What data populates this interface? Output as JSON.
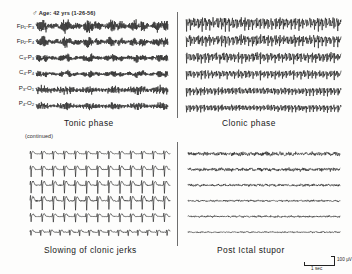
{
  "figure": {
    "header": {
      "sex_symbol": "♂",
      "text": "Age: 42 yrs (1-26-56)"
    },
    "continued_label": "(continued)",
    "channels": [
      {
        "label": "Fp1-F3",
        "name": "fp1-f3"
      },
      {
        "label": "Fp2-F4",
        "name": "fp2-f4"
      },
      {
        "label": "C3-P3",
        "name": "c3-p3"
      },
      {
        "label": "C4-P4",
        "name": "c4-p4"
      },
      {
        "label": "P3-O1",
        "name": "p3-o1"
      },
      {
        "label": "P4-O2",
        "name": "p4-o2"
      }
    ],
    "calibration": {
      "amplitude": "100 µV",
      "time": "1 sec"
    },
    "ink_color": "#1a1a1a",
    "background_color": "#fdfdfc"
  },
  "chart_data": {
    "type": "line",
    "title": "Age: 42 yrs (1-26-56)",
    "xlabel": "1 sec",
    "ylabel": "100 µV",
    "grid": false,
    "legend": "none",
    "channels": [
      "Fp1-F3",
      "Fp2-F4",
      "C3-P3",
      "C4-P4",
      "P3-O1",
      "P4-O2"
    ],
    "calibration": {
      "amplitude_uv": 100,
      "time_sec": 1
    },
    "panels": [
      {
        "id": "tonic-phase",
        "caption": "Tonic phase",
        "position": "top-left",
        "morphology": "continuous low-voltage fast recruiting rhythm",
        "dominant_frequency_hz": 14,
        "approx_amplitude_uv": [
          30,
          70
        ],
        "series": [
          {
            "name": "Fp1-F3",
            "freq_hz": 14,
            "amp_uv": 62,
            "noise": 0.55
          },
          {
            "name": "Fp2-F4",
            "freq_hz": 14,
            "amp_uv": 50,
            "noise": 0.5
          },
          {
            "name": "C3-P3",
            "freq_hz": 15,
            "amp_uv": 40,
            "noise": 0.45
          },
          {
            "name": "C4-P4",
            "freq_hz": 15,
            "amp_uv": 34,
            "noise": 0.45
          },
          {
            "name": "P3-O1",
            "freq_hz": 13,
            "amp_uv": 44,
            "noise": 0.5
          },
          {
            "name": "P4-O2",
            "freq_hz": 13,
            "amp_uv": 38,
            "noise": 0.48
          }
        ]
      },
      {
        "id": "clonic-phase",
        "caption": "Clonic phase",
        "position": "top-right",
        "morphology": "rhythmic high-voltage spike-and-slow-wave bursts",
        "dominant_frequency_hz": 4,
        "approx_amplitude_uv": [
          80,
          150
        ],
        "series": [
          {
            "name": "Fp1-F3",
            "freq_hz": 4.0,
            "amp_uv": 140,
            "noise": 0.35
          },
          {
            "name": "Fp2-F4",
            "freq_hz": 4.0,
            "amp_uv": 128,
            "noise": 0.35
          },
          {
            "name": "C3-P3",
            "freq_hz": 4.2,
            "amp_uv": 112,
            "noise": 0.32
          },
          {
            "name": "C4-P4",
            "freq_hz": 4.2,
            "amp_uv": 96,
            "noise": 0.32
          },
          {
            "name": "P3-O1",
            "freq_hz": 4.4,
            "amp_uv": 88,
            "noise": 0.3
          },
          {
            "name": "P4-O2",
            "freq_hz": 4.4,
            "amp_uv": 80,
            "noise": 0.3
          }
        ]
      },
      {
        "id": "slowing-of-clonic-jerks",
        "caption": "Slowing of clonic jerks",
        "position": "bottom-left",
        "morphology": "discrete periodic spike-wave complexes separated by flattening",
        "dominant_frequency_hz": 1.4,
        "approx_amplitude_uv": [
          60,
          120
        ],
        "series": [
          {
            "name": "Fp1-F3",
            "freq_hz": 1.4,
            "amp_uv": 70,
            "noise": 0.12
          },
          {
            "name": "Fp2-F4",
            "freq_hz": 1.4,
            "amp_uv": 96,
            "noise": 0.14
          },
          {
            "name": "C3-P3",
            "freq_hz": 1.4,
            "amp_uv": 108,
            "noise": 0.16
          },
          {
            "name": "C4-P4",
            "freq_hz": 1.4,
            "amp_uv": 120,
            "noise": 0.18
          },
          {
            "name": "P3-O1",
            "freq_hz": 1.4,
            "amp_uv": 74,
            "noise": 0.16
          },
          {
            "name": "P4-O2",
            "freq_hz": 1.6,
            "amp_uv": 62,
            "noise": 0.22
          }
        ]
      },
      {
        "id": "post-ictal-stupor",
        "caption": "Post Ictal stupor",
        "position": "bottom-right",
        "morphology": "marked generalized voltage suppression, near-flat record",
        "dominant_frequency_hz": 2,
        "approx_amplitude_uv": [
          3,
          10
        ],
        "series": [
          {
            "name": "Fp1-F3",
            "freq_hz": 2.0,
            "amp_uv": 9,
            "noise": 0.9
          },
          {
            "name": "Fp2-F4",
            "freq_hz": 2.0,
            "amp_uv": 8,
            "noise": 0.9
          },
          {
            "name": "C3-P3",
            "freq_hz": 2.2,
            "amp_uv": 6,
            "noise": 0.8
          },
          {
            "name": "C4-P4",
            "freq_hz": 2.2,
            "amp_uv": 5,
            "noise": 0.7
          },
          {
            "name": "P3-O1",
            "freq_hz": 2.4,
            "amp_uv": 5,
            "noise": 0.7
          },
          {
            "name": "P4-O2",
            "freq_hz": 2.4,
            "amp_uv": 4,
            "noise": 0.6
          }
        ]
      }
    ]
  }
}
